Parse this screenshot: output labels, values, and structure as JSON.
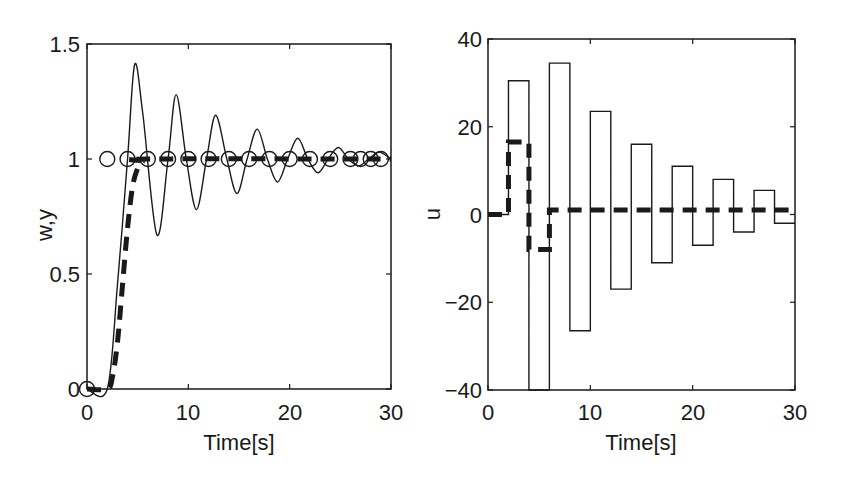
{
  "chart_data": [
    {
      "type": "line",
      "title": "",
      "xlabel": "Time[s]",
      "ylabel": "w,y",
      "xlim": [
        0,
        30
      ],
      "ylim": [
        0,
        1.5
      ],
      "xticks": [
        "0",
        "10",
        "20",
        "30"
      ],
      "yticks": [
        "0",
        "0.5",
        "1",
        "1.5"
      ],
      "grid": false,
      "legend": [],
      "series": [
        {
          "name": "y (solid, oscillating response)",
          "style": "solid-thin",
          "x": [
            0,
            2,
            3,
            4,
            4.7,
            5.5,
            6.9,
            8.0,
            8.8,
            9.8,
            10.8,
            11.8,
            12.7,
            13.8,
            14.8,
            15.8,
            16.8,
            17.8,
            18.8,
            19.8,
            20.8,
            21.8,
            22.8,
            23.8,
            24.8,
            25.8,
            26.8,
            27.8,
            28.8,
            30
          ],
          "y": [
            0,
            0,
            0.45,
            1.0,
            1.41,
            1.2,
            0.67,
            1.0,
            1.28,
            1.0,
            0.78,
            1.0,
            1.19,
            1.0,
            0.85,
            1.0,
            1.13,
            1.0,
            0.9,
            1.0,
            1.09,
            1.0,
            0.94,
            1.0,
            1.05,
            1.0,
            0.97,
            1.0,
            1.03,
            1.0
          ]
        },
        {
          "name": "y (dashed, reference model response)",
          "style": "dashed-thick",
          "x": [
            0,
            2,
            2.5,
            3,
            3.5,
            4,
            4.5,
            5,
            5.5,
            6,
            30
          ],
          "y": [
            0,
            0,
            0.05,
            0.2,
            0.45,
            0.7,
            0.88,
            0.96,
            0.99,
            1.0,
            1.0
          ]
        },
        {
          "name": "w (reference, circle markers)",
          "style": "markers-circle",
          "x": [
            0,
            2,
            4,
            6,
            8,
            10,
            12,
            14,
            16,
            18,
            20,
            22,
            24,
            26,
            27,
            28,
            29
          ],
          "y": [
            0,
            1,
            1,
            1,
            1,
            1,
            1,
            1,
            1,
            1,
            1,
            1,
            1,
            1,
            1,
            1,
            1
          ]
        }
      ]
    },
    {
      "type": "line",
      "title": "",
      "xlabel": "Time[s]",
      "ylabel": "u",
      "xlim": [
        0,
        30
      ],
      "ylim": [
        -40,
        40
      ],
      "xticks": [
        "0",
        "10",
        "20",
        "30"
      ],
      "yticks": [
        "-40",
        "-20",
        "0",
        "20",
        "40"
      ],
      "grid": false,
      "legend": [],
      "series": [
        {
          "name": "u (solid, staircase control)",
          "style": "solid-thin-step",
          "x": [
            0,
            2,
            4,
            6,
            8,
            10,
            12,
            14,
            16,
            18,
            20,
            22,
            24,
            26,
            28,
            30
          ],
          "y": [
            0,
            30.5,
            -40,
            34.5,
            -26.5,
            23.5,
            -17,
            16,
            -11,
            11,
            -7,
            8,
            -4,
            5.5,
            -2,
            -2
          ]
        },
        {
          "name": "u (dashed, staircase control)",
          "style": "dashed-thick-step",
          "x": [
            0,
            2,
            4,
            6,
            30
          ],
          "y": [
            0,
            16.5,
            -8,
            1,
            1
          ]
        }
      ]
    }
  ],
  "left_plot": {
    "ylabel": "w,y",
    "xlabel": "Time[s]",
    "xticks": [
      "0",
      "10",
      "20",
      "30"
    ],
    "yticks": [
      "0",
      "0.5",
      "1",
      "1.5"
    ]
  },
  "right_plot": {
    "ylabel": "u",
    "xlabel": "Time[s]",
    "xticks": [
      "0",
      "10",
      "20",
      "30"
    ],
    "yticks": [
      "-40",
      "-20",
      "0",
      "20",
      "40"
    ]
  }
}
